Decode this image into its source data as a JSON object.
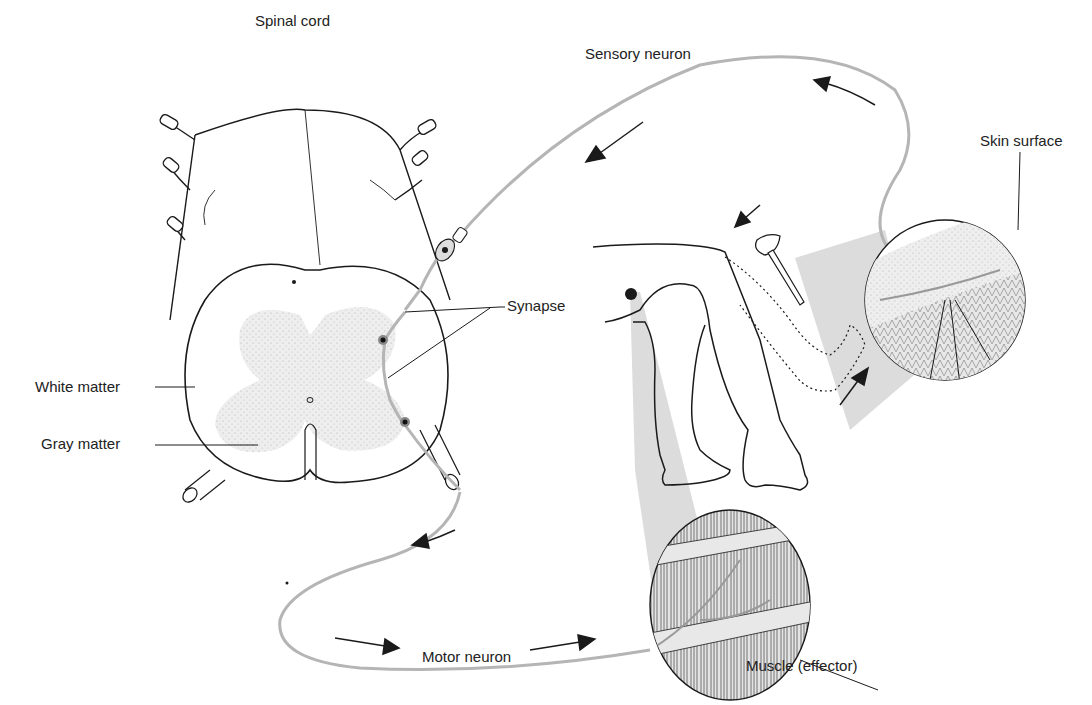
{
  "labels": {
    "spinal_cord": "Spinal cord",
    "sensory_neuron": "Sensory neuron",
    "skin_surface": "Skin surface",
    "synapse": "Synapse",
    "white_matter": "White matter",
    "gray_matter": "Gray matter",
    "motor_neuron": "Motor neuron",
    "muscle": "Muscle (effector)"
  },
  "colors": {
    "neuron": "#b5b5b5",
    "outline": "#1a1a1a",
    "gray_matter": "#e6e6e6",
    "cone": "#dcdcdc",
    "text": "#222222"
  }
}
